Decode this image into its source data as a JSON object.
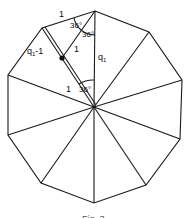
{
  "diagram": {
    "shape": "regular decagon",
    "center": [
      94,
      107
    ],
    "vertices": [
      [
        95,
        11
      ],
      [
        149,
        32
      ],
      [
        182,
        80
      ],
      [
        180,
        139
      ],
      [
        146,
        185
      ],
      [
        94,
        203
      ],
      [
        41,
        183
      ],
      [
        8,
        135
      ],
      [
        8,
        75
      ],
      [
        42,
        28
      ]
    ],
    "line_color": "#1a1a1a",
    "labels": {
      "top_edge": "1",
      "angle_top_left": "36°",
      "angle_top_right": "36°",
      "inner_segment": "1",
      "radius_right": "q",
      "radius_right_sub": "1",
      "left_segment": "q",
      "left_segment_sub": "1",
      "left_segment_suffix": "-1",
      "lower_segment": "1",
      "angle_center": "36°"
    },
    "point": {
      "label": "marked point",
      "position": [
        62,
        58
      ]
    },
    "caption": "Fig. 3"
  }
}
